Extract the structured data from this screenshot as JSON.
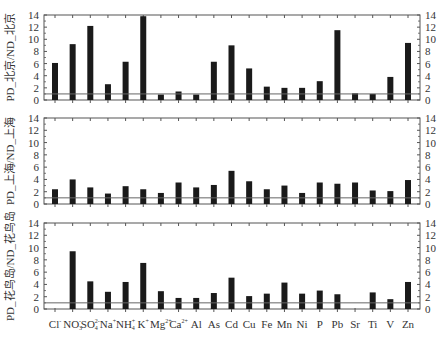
{
  "chart_data": {
    "type": "bar",
    "layout": "3 stacked panels sharing x-axis, y-axis ticks on both sides",
    "categories": [
      "Cl⁻",
      "NO₃⁻",
      "SO₄²⁻",
      "Na⁺",
      "NH₄⁺",
      "K⁺",
      "Mg²⁺",
      "Ca²⁺",
      "Al",
      "As",
      "Cd",
      "Cu",
      "Fe",
      "Mn",
      "Ni",
      "P",
      "Pb",
      "Sr",
      "Ti",
      "V",
      "Zn"
    ],
    "category_labels": [
      {
        "base": "Cl",
        "sup": "-",
        "sub": ""
      },
      {
        "base": "NO",
        "sup": "-",
        "sub": "3"
      },
      {
        "base": "SO",
        "sup": "2-",
        "sub": "4"
      },
      {
        "base": "Na",
        "sup": "+",
        "sub": ""
      },
      {
        "base": "NH",
        "sup": "+",
        "sub": "4"
      },
      {
        "base": "K",
        "sup": "+",
        "sub": ""
      },
      {
        "base": "Mg",
        "sup": "2+",
        "sub": ""
      },
      {
        "base": "Ca",
        "sup": "2+",
        "sub": ""
      },
      {
        "base": "Al",
        "sup": "",
        "sub": ""
      },
      {
        "base": "As",
        "sup": "",
        "sub": ""
      },
      {
        "base": "Cd",
        "sup": "",
        "sub": ""
      },
      {
        "base": "Cu",
        "sup": "",
        "sub": ""
      },
      {
        "base": "Fe",
        "sup": "",
        "sub": ""
      },
      {
        "base": "Mn",
        "sup": "",
        "sub": ""
      },
      {
        "base": "Ni",
        "sup": "",
        "sub": ""
      },
      {
        "base": "P",
        "sup": "",
        "sub": ""
      },
      {
        "base": "Pb",
        "sup": "",
        "sub": ""
      },
      {
        "base": "Sr",
        "sup": "",
        "sub": ""
      },
      {
        "base": "Ti",
        "sup": "",
        "sub": ""
      },
      {
        "base": "V",
        "sup": "",
        "sub": ""
      },
      {
        "base": "Zn",
        "sup": "",
        "sub": ""
      }
    ],
    "panels": [
      {
        "ylabel": "PD_北京/ND_北京",
        "ylim": [
          0,
          14
        ],
        "yticks": [
          0,
          2,
          4,
          6,
          8,
          10,
          12,
          14
        ],
        "reference_line": 1,
        "values": [
          6.1,
          9.2,
          12.2,
          2.6,
          6.3,
          13.8,
          0.9,
          1.4,
          0.9,
          6.3,
          9.0,
          5.2,
          2.2,
          2.0,
          2.0,
          3.1,
          11.5,
          1.1,
          1.0,
          3.8,
          9.4
        ]
      },
      {
        "ylabel": "PD_上海/ND_上海",
        "ylim": [
          0,
          14
        ],
        "yticks": [
          0,
          2,
          4,
          6,
          8,
          10,
          12,
          14
        ],
        "reference_line": 1,
        "values": [
          2.4,
          4.0,
          2.7,
          1.7,
          2.9,
          2.4,
          1.8,
          3.5,
          2.7,
          3.1,
          5.4,
          3.7,
          2.4,
          3.0,
          1.8,
          3.5,
          3.3,
          3.5,
          2.2,
          2.1,
          3.9
        ]
      },
      {
        "ylabel": "PD_花鸟岛/ND_花鸟岛",
        "ylim": [
          0,
          14
        ],
        "yticks": [
          0,
          2,
          4,
          6,
          8,
          10,
          12,
          14
        ],
        "reference_line": 1,
        "values": [
          null,
          9.4,
          4.5,
          2.8,
          4.4,
          7.5,
          2.9,
          1.8,
          1.8,
          2.6,
          5.1,
          2.1,
          2.5,
          4.3,
          2.5,
          3.0,
          2.4,
          null,
          2.7,
          1.6,
          4.4
        ]
      }
    ],
    "title": "",
    "xlabel": "",
    "legend": "none",
    "grid": false
  },
  "colors": {
    "bar": "#1a1a1a",
    "axis": "#555555",
    "reference_line": "#666666",
    "background": "#ffffff"
  }
}
